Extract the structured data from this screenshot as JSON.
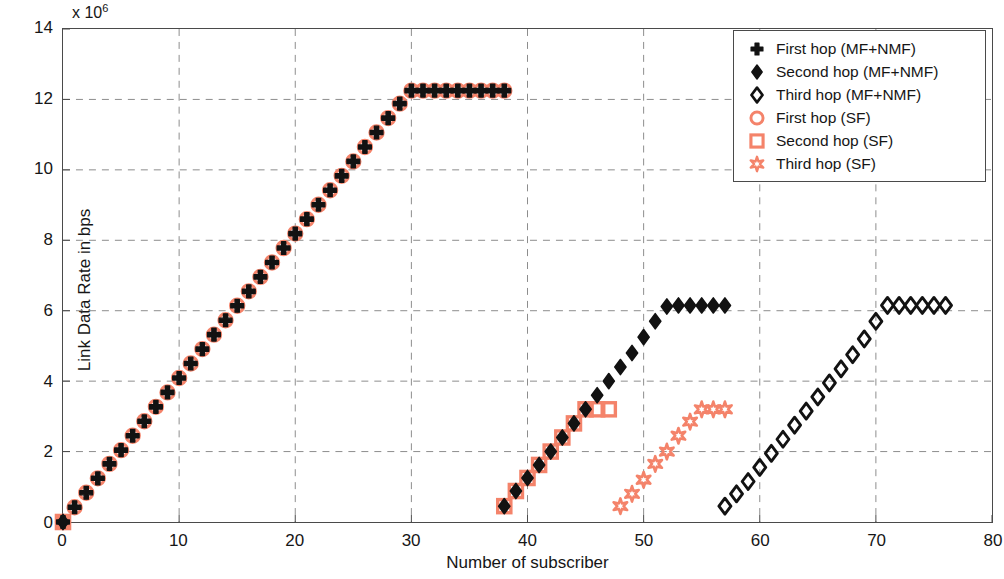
{
  "chart_data": {
    "type": "scatter",
    "title": "",
    "xlabel": "Number of subscriber",
    "ylabel": "Link Data Rate in bps",
    "y_exponent_label": "x 10",
    "y_exponent_power": "6",
    "xlim": [
      0,
      80
    ],
    "ylim": [
      0,
      14000000
    ],
    "xticks": [
      0,
      10,
      20,
      30,
      40,
      50,
      60,
      70,
      80
    ],
    "yticks": [
      0,
      2,
      4,
      6,
      8,
      10,
      12,
      14
    ],
    "ytick_labels": [
      "0",
      "2",
      "4",
      "6",
      "8",
      "10",
      "12",
      "14"
    ],
    "xtick_labels": [
      "0",
      "10",
      "20",
      "30",
      "40",
      "50",
      "60",
      "70",
      "80"
    ],
    "grid": true,
    "grid_style": "dashed",
    "legend_position": "top-right",
    "colors": {
      "mf_nmf": "#121212",
      "sf": "#F4836A",
      "axis": "#4a4a4a",
      "grid": "#8d8d8d",
      "background": "#ffffff"
    },
    "series": [
      {
        "name": "First hop (MF+NMF)",
        "marker": "plus",
        "color": "#121212",
        "points": [
          [
            0,
            0
          ],
          [
            1,
            420000
          ],
          [
            2,
            830000
          ],
          [
            3,
            1240000
          ],
          [
            4,
            1650000
          ],
          [
            5,
            2040000
          ],
          [
            6,
            2450000
          ],
          [
            7,
            2860000
          ],
          [
            8,
            3270000
          ],
          [
            9,
            3680000
          ],
          [
            10,
            4090000
          ],
          [
            11,
            4500000
          ],
          [
            12,
            4910000
          ],
          [
            13,
            5320000
          ],
          [
            14,
            5730000
          ],
          [
            15,
            6140000
          ],
          [
            16,
            6550000
          ],
          [
            17,
            6960000
          ],
          [
            18,
            7370000
          ],
          [
            19,
            7780000
          ],
          [
            20,
            8190000
          ],
          [
            21,
            8600000
          ],
          [
            22,
            9010000
          ],
          [
            23,
            9420000
          ],
          [
            24,
            9830000
          ],
          [
            25,
            10240000
          ],
          [
            26,
            10650000
          ],
          [
            27,
            11060000
          ],
          [
            28,
            11470000
          ],
          [
            29,
            11880000
          ],
          [
            30,
            12250000
          ],
          [
            31,
            12250000
          ],
          [
            32,
            12250000
          ],
          [
            33,
            12250000
          ],
          [
            34,
            12250000
          ],
          [
            35,
            12250000
          ],
          [
            36,
            12250000
          ],
          [
            37,
            12250000
          ],
          [
            38,
            12250000
          ]
        ]
      },
      {
        "name": "First hop (SF)",
        "marker": "circle",
        "color": "#F4836A",
        "points": [
          [
            0,
            0
          ],
          [
            1,
            420000
          ],
          [
            2,
            830000
          ],
          [
            3,
            1240000
          ],
          [
            4,
            1650000
          ],
          [
            5,
            2040000
          ],
          [
            6,
            2450000
          ],
          [
            7,
            2860000
          ],
          [
            8,
            3270000
          ],
          [
            9,
            3680000
          ],
          [
            10,
            4090000
          ],
          [
            11,
            4500000
          ],
          [
            12,
            4910000
          ],
          [
            13,
            5320000
          ],
          [
            14,
            5730000
          ],
          [
            15,
            6140000
          ],
          [
            16,
            6550000
          ],
          [
            17,
            6960000
          ],
          [
            18,
            7370000
          ],
          [
            19,
            7780000
          ],
          [
            20,
            8190000
          ],
          [
            21,
            8600000
          ],
          [
            22,
            9010000
          ],
          [
            23,
            9420000
          ],
          [
            24,
            9830000
          ],
          [
            25,
            10240000
          ],
          [
            26,
            10650000
          ],
          [
            27,
            11060000
          ],
          [
            28,
            11470000
          ],
          [
            29,
            11880000
          ],
          [
            30,
            12250000
          ],
          [
            31,
            12250000
          ],
          [
            32,
            12250000
          ],
          [
            33,
            12250000
          ],
          [
            34,
            12250000
          ],
          [
            35,
            12250000
          ],
          [
            36,
            12250000
          ],
          [
            37,
            12250000
          ],
          [
            38,
            12250000
          ]
        ]
      },
      {
        "name": "Second hop (MF+NMF)",
        "marker": "diamond-filled",
        "color": "#121212",
        "points": [
          [
            0,
            0
          ],
          [
            38,
            450000
          ],
          [
            39,
            880000
          ],
          [
            40,
            1250000
          ],
          [
            41,
            1620000
          ],
          [
            42,
            2000000
          ],
          [
            43,
            2400000
          ],
          [
            44,
            2800000
          ],
          [
            45,
            3200000
          ],
          [
            46,
            3600000
          ],
          [
            47,
            4000000
          ],
          [
            48,
            4400000
          ],
          [
            49,
            4800000
          ],
          [
            50,
            5250000
          ],
          [
            51,
            5700000
          ],
          [
            52,
            6120000
          ],
          [
            53,
            6150000
          ],
          [
            54,
            6150000
          ],
          [
            55,
            6150000
          ],
          [
            56,
            6150000
          ],
          [
            57,
            6150000
          ]
        ]
      },
      {
        "name": "Second hop (SF)",
        "marker": "square",
        "color": "#F4836A",
        "points": [
          [
            0,
            0
          ],
          [
            38,
            450000
          ],
          [
            39,
            880000
          ],
          [
            40,
            1250000
          ],
          [
            41,
            1620000
          ],
          [
            42,
            2000000
          ],
          [
            43,
            2400000
          ],
          [
            44,
            2800000
          ],
          [
            45,
            3200000
          ],
          [
            46,
            3200000
          ],
          [
            47,
            3200000
          ]
        ]
      },
      {
        "name": "Third hop (MF+NMF)",
        "marker": "diamond-open",
        "color": "#121212",
        "points": [
          [
            57,
            450000
          ],
          [
            58,
            800000
          ],
          [
            59,
            1150000
          ],
          [
            60,
            1550000
          ],
          [
            61,
            1950000
          ],
          [
            62,
            2350000
          ],
          [
            63,
            2750000
          ],
          [
            64,
            3150000
          ],
          [
            65,
            3550000
          ],
          [
            66,
            3950000
          ],
          [
            67,
            4350000
          ],
          [
            68,
            4750000
          ],
          [
            69,
            5200000
          ],
          [
            70,
            5700000
          ],
          [
            71,
            6150000
          ],
          [
            72,
            6150000
          ],
          [
            73,
            6150000
          ],
          [
            74,
            6150000
          ],
          [
            75,
            6150000
          ],
          [
            76,
            6150000
          ]
        ]
      },
      {
        "name": "Third hop (SF)",
        "marker": "star",
        "color": "#F4836A",
        "points": [
          [
            48,
            450000
          ],
          [
            49,
            800000
          ],
          [
            50,
            1200000
          ],
          [
            51,
            1650000
          ],
          [
            52,
            2000000
          ],
          [
            53,
            2450000
          ],
          [
            54,
            2850000
          ],
          [
            55,
            3200000
          ],
          [
            56,
            3200000
          ],
          [
            57,
            3200000
          ]
        ]
      }
    ]
  },
  "legend": {
    "entries": [
      {
        "label": "First hop (MF+NMF)",
        "marker": "plus",
        "color": "#121212"
      },
      {
        "label": "Second hop (MF+NMF)",
        "marker": "diamond-filled",
        "color": "#121212"
      },
      {
        "label": "Third hop (MF+NMF)",
        "marker": "diamond-open",
        "color": "#121212"
      },
      {
        "label": "First hop (SF)",
        "marker": "circle",
        "color": "#F4836A"
      },
      {
        "label": "Second hop (SF)",
        "marker": "square",
        "color": "#F4836A"
      },
      {
        "label": "Third hop (SF)",
        "marker": "star",
        "color": "#F4836A"
      }
    ]
  }
}
